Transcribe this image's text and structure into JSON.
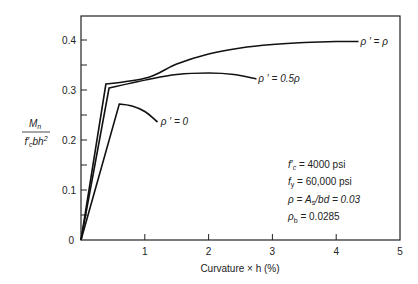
{
  "chart_data": {
    "type": "line",
    "title": "",
    "xlabel": "Curvature × h (%)",
    "ylabel_numerator": "M_n",
    "ylabel_denominator": "f'_c bh^2",
    "xlim": [
      0,
      5
    ],
    "ylim": [
      0,
      0.44
    ],
    "xticks": [
      0,
      1,
      2,
      3,
      4,
      5
    ],
    "xtick_labels": [
      "",
      "1",
      "2",
      "3",
      "4",
      "5"
    ],
    "yticks": [
      0,
      0.05,
      0.1,
      0.15,
      0.2,
      0.25,
      0.3,
      0.35,
      0.4
    ],
    "ytick_labels": [
      "0",
      "",
      "0.1",
      "",
      "0.2",
      "",
      "0.3",
      "",
      "0.4"
    ],
    "origin_label": "0",
    "grid": false,
    "series": [
      {
        "name": "ρ' = ρ",
        "label": "ρ ′  =  ρ",
        "x": [
          0,
          0.39,
          1.05,
          1.5,
          2.0,
          2.5,
          3.0,
          3.5,
          4.0,
          4.35
        ],
        "y": [
          0,
          0.312,
          0.325,
          0.352,
          0.372,
          0.384,
          0.391,
          0.395,
          0.397,
          0.397
        ]
      },
      {
        "name": "ρ' = 0.5ρ",
        "label": "ρ ′  =  0.5ρ",
        "x": [
          0,
          0.44,
          1.05,
          1.5,
          2.0,
          2.4,
          2.75
        ],
        "y": [
          0,
          0.304,
          0.321,
          0.331,
          0.334,
          0.331,
          0.322
        ]
      },
      {
        "name": "ρ' = 0",
        "label": "ρ ′  =  0",
        "x": [
          0,
          0.6,
          0.8,
          1.0,
          1.2
        ],
        "y": [
          0,
          0.272,
          0.268,
          0.257,
          0.236
        ]
      }
    ],
    "annotations": [
      "f'c = 4000 psi",
      "fy = 60,000 psi",
      "ρ = As/bd = 0.03",
      "ρb = 0.0285"
    ]
  },
  "legend_box": {
    "fc_sym": "f′",
    "fc_sub": "c",
    "fc_val": " = 4000 psi",
    "fy_sym": "f",
    "fy_sub": "y",
    "fy_val": " = 60,000 psi",
    "rho_line": "ρ = A",
    "rho_sub": "s",
    "rho_rest": "/bd = 0.03",
    "rhob_sym": "ρ",
    "rhob_sub": "b",
    "rhob_val": " = 0.0285"
  },
  "ylabel": {
    "num": "M",
    "num_sub": "n",
    "den_a": "f′",
    "den_sub": "c",
    "den_b": "bh",
    "den_sup": "2"
  }
}
